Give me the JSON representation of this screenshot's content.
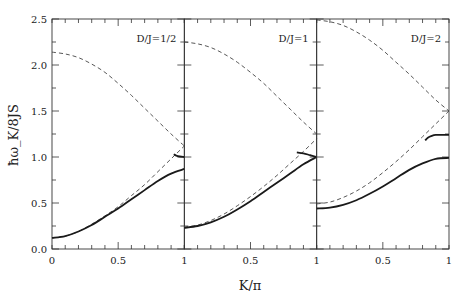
{
  "chart_data": {
    "type": "line",
    "title": "",
    "xlabel": "K/π",
    "ylabel": "ħω_K/8JS",
    "ylim": [
      0,
      2.5
    ],
    "xlim": [
      0,
      1
    ],
    "yticks": [
      "0.0",
      "0.5",
      "1.0",
      "1.5",
      "2.0",
      "2.5"
    ],
    "xticks": [
      "0",
      "0.5",
      "1"
    ],
    "grid": false,
    "legend": null,
    "panels": [
      {
        "label": "D/J=1/2",
        "series": [
          {
            "name": "upper-dashed",
            "style": "dashed",
            "x": [
              0,
              0.1,
              0.2,
              0.3,
              0.4,
              0.5,
              0.6,
              0.7,
              0.8,
              0.9,
              1.0
            ],
            "y": [
              2.14,
              2.12,
              2.08,
              2.01,
              1.92,
              1.8,
              1.67,
              1.53,
              1.39,
              1.25,
              1.12
            ]
          },
          {
            "name": "lower-dashed",
            "style": "dashed",
            "x": [
              0,
              0.1,
              0.2,
              0.3,
              0.4,
              0.5,
              0.6,
              0.7,
              0.8,
              0.9,
              1.0
            ],
            "y": [
              0.12,
              0.14,
              0.19,
              0.27,
              0.36,
              0.46,
              0.58,
              0.7,
              0.84,
              0.98,
              1.12
            ]
          },
          {
            "name": "lower-solid",
            "style": "solid",
            "x": [
              0,
              0.1,
              0.2,
              0.3,
              0.4,
              0.5,
              0.6,
              0.7,
              0.8,
              0.9,
              1.0
            ],
            "y": [
              0.12,
              0.14,
              0.19,
              0.26,
              0.35,
              0.44,
              0.54,
              0.64,
              0.74,
              0.82,
              0.87
            ]
          },
          {
            "name": "upper-solid",
            "style": "solid",
            "x": [
              0.92,
              0.95,
              1.0
            ],
            "y": [
              1.03,
              1.01,
              1.0
            ]
          }
        ]
      },
      {
        "label": "D/J=1",
        "series": [
          {
            "name": "upper-dashed",
            "style": "dashed",
            "x": [
              0,
              0.1,
              0.2,
              0.3,
              0.4,
              0.5,
              0.6,
              0.7,
              0.8,
              0.9,
              1.0
            ],
            "y": [
              2.25,
              2.23,
              2.19,
              2.12,
              2.03,
              1.92,
              1.8,
              1.66,
              1.52,
              1.38,
              1.25
            ]
          },
          {
            "name": "lower-dashed",
            "style": "dashed",
            "x": [
              0,
              0.1,
              0.2,
              0.3,
              0.4,
              0.5,
              0.6,
              0.7,
              0.8,
              0.9,
              1.0
            ],
            "y": [
              0.24,
              0.26,
              0.31,
              0.38,
              0.47,
              0.57,
              0.68,
              0.8,
              0.93,
              1.06,
              1.2
            ]
          },
          {
            "name": "lower-solid",
            "style": "solid",
            "x": [
              0,
              0.1,
              0.2,
              0.3,
              0.4,
              0.5,
              0.6,
              0.7,
              0.8,
              0.9,
              1.0
            ],
            "y": [
              0.23,
              0.25,
              0.29,
              0.35,
              0.43,
              0.52,
              0.62,
              0.72,
              0.82,
              0.92,
              1.0
            ]
          },
          {
            "name": "upper-solid",
            "style": "solid",
            "x": [
              0.85,
              0.9,
              0.95,
              1.0
            ],
            "y": [
              1.05,
              1.04,
              1.02,
              1.0
            ]
          }
        ]
      },
      {
        "label": "D/J=2",
        "series": [
          {
            "name": "upper-dashed",
            "style": "dashed",
            "x": [
              0,
              0.1,
              0.2,
              0.3,
              0.4,
              0.5,
              0.6,
              0.7,
              0.8,
              0.9,
              1.0
            ],
            "y": [
              2.49,
              2.47,
              2.43,
              2.36,
              2.27,
              2.16,
              2.03,
              1.9,
              1.76,
              1.62,
              1.5
            ]
          },
          {
            "name": "lower-dashed",
            "style": "dashed",
            "x": [
              0,
              0.1,
              0.2,
              0.3,
              0.4,
              0.5,
              0.6,
              0.7,
              0.8,
              0.9,
              1.0
            ],
            "y": [
              0.49,
              0.51,
              0.56,
              0.63,
              0.72,
              0.83,
              0.95,
              1.08,
              1.22,
              1.36,
              1.5
            ]
          },
          {
            "name": "lower-solid",
            "style": "solid",
            "x": [
              0,
              0.1,
              0.2,
              0.3,
              0.4,
              0.5,
              0.6,
              0.7,
              0.8,
              0.9,
              1.0
            ],
            "y": [
              0.44,
              0.45,
              0.48,
              0.53,
              0.6,
              0.68,
              0.77,
              0.86,
              0.93,
              0.98,
              0.99
            ]
          },
          {
            "name": "upper-solid",
            "style": "solid",
            "x": [
              0.82,
              0.84,
              0.87,
              0.9,
              0.95,
              1.0
            ],
            "y": [
              1.18,
              1.21,
              1.23,
              1.24,
              1.24,
              1.24
            ]
          }
        ]
      }
    ]
  },
  "colors": {
    "line": "#1a1a1a",
    "dashed": "#444444",
    "axis": "#333333"
  }
}
